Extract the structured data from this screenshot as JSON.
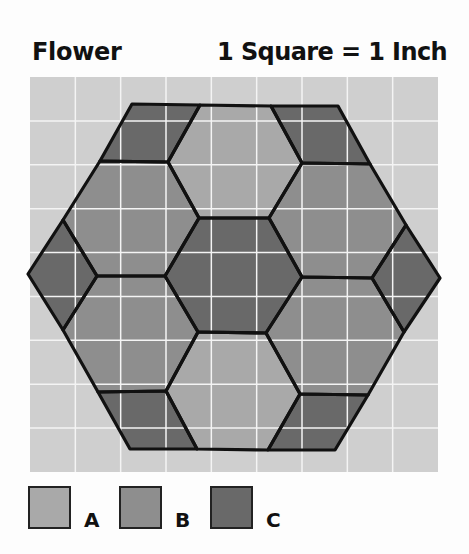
{
  "header": {
    "title": "Flower",
    "scale_note": "1 Square = 1 Inch"
  },
  "grid": {
    "x": 30,
    "y": 77,
    "width": 408,
    "height": 395,
    "columns": 9,
    "rows": 9,
    "background": "#cfcfcf",
    "line_color": "#f4f4f4"
  },
  "colors": {
    "A": "#a9a9a9",
    "B": "#8e8e8e",
    "C": "#696969",
    "outline": "#111111"
  },
  "pieces": [
    {
      "name": "top-left-parallelogram",
      "fabric": "C",
      "points": "132,104 200,105 168,162 100,161"
    },
    {
      "name": "top-hexagon",
      "fabric": "A",
      "points": "200,105 271,106 302,163 269,218 199,218 168,162"
    },
    {
      "name": "top-right-parallelogram",
      "fabric": "C",
      "points": "271,106 338,106 370,164 302,163"
    },
    {
      "name": "upper-left-hexagon",
      "fabric": "B",
      "points": "100,161 168,162 199,218 165,276 97,276 63,220"
    },
    {
      "name": "upper-right-hexagon",
      "fabric": "B",
      "points": "302,163 370,164 406,225 372,278 302,277 269,218"
    },
    {
      "name": "left-diamond",
      "fabric": "C",
      "points": "63,220 97,276 63,330 28,274"
    },
    {
      "name": "center-hexagon",
      "fabric": "C",
      "points": "199,218 269,218 302,277 266,333 198,332 165,276"
    },
    {
      "name": "right-diamond",
      "fabric": "C",
      "points": "406,225 440,278 404,332 372,278"
    },
    {
      "name": "lower-left-hexagon",
      "fabric": "B",
      "points": "97,276 165,276 198,332 166,391 98,392 63,330"
    },
    {
      "name": "lower-right-hexagon",
      "fabric": "B",
      "points": "302,277 372,278 404,332 368,395 300,394 266,333"
    },
    {
      "name": "bottom-left-parallelogram",
      "fabric": "C",
      "points": "98,392 166,391 197,449 130,449"
    },
    {
      "name": "bottom-hexagon",
      "fabric": "A",
      "points": "198,332 266,333 300,394 268,450 197,449 166,391"
    },
    {
      "name": "bottom-right-parallelogram",
      "fabric": "C",
      "points": "300,394 368,395 335,450 268,450"
    }
  ],
  "legend": [
    {
      "label": "A",
      "fabric": "A",
      "swatch_x": 28,
      "label_x": 84
    },
    {
      "label": "B",
      "fabric": "B",
      "swatch_x": 119,
      "label_x": 175
    },
    {
      "label": "C",
      "fabric": "C",
      "swatch_x": 210,
      "label_x": 266
    }
  ]
}
